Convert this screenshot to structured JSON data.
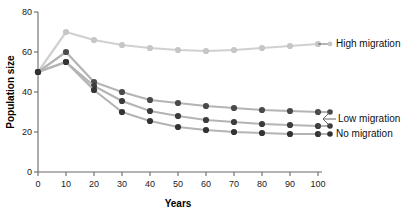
{
  "chart_data": {
    "type": "line",
    "title": "",
    "xlabel": "Years",
    "ylabel": "Population size",
    "x": [
      0,
      10,
      20,
      30,
      40,
      50,
      60,
      70,
      80,
      90,
      100
    ],
    "xlim": [
      0,
      100
    ],
    "ylim": [
      0,
      80
    ],
    "xticks": [
      "0",
      "10",
      "20",
      "30",
      "40",
      "50",
      "60",
      "70",
      "80",
      "90",
      "100"
    ],
    "yticks": [
      "0",
      "20",
      "40",
      "60",
      "80"
    ],
    "grid": false,
    "legend_position": "right-inline-labels",
    "series": [
      {
        "name": "High migration",
        "color": "#d0d0d0",
        "marker_color": "#c6c6c6",
        "values": [
          50,
          70,
          66,
          63.5,
          62,
          61,
          60.5,
          61,
          62,
          63,
          64
        ]
      },
      {
        "name": "Low migration",
        "color": "#b4b4b4",
        "marker_color": "#4a4a4a",
        "values": [
          50,
          60,
          45,
          40,
          36,
          34.5,
          33,
          32,
          31,
          30.5,
          30
        ]
      },
      {
        "name": "Low migration",
        "color": "#b4b4b4",
        "marker_color": "#3c3c3c",
        "values": [
          50,
          55,
          43,
          35.5,
          30.5,
          28,
          26,
          25,
          24,
          23.5,
          23
        ]
      },
      {
        "name": "No migration",
        "color": "#b4b4b4",
        "marker_color": "#333333",
        "values": [
          50,
          55,
          41,
          30,
          25.5,
          22.5,
          21,
          20,
          19.5,
          19,
          19
        ]
      }
    ],
    "annotations": [
      {
        "text": "High migration",
        "for_series": "High migration",
        "x": 100,
        "y": 64
      },
      {
        "text": "Low migration",
        "for_series": "Low migration",
        "x": 100,
        "y": 26.5
      },
      {
        "text": "No migration",
        "for_series": "No migration",
        "x": 100,
        "y": 19
      }
    ]
  },
  "labels": {
    "y_axis_title": "Population size",
    "x_axis_title": "Years",
    "high_migration": "High migration",
    "low_migration": "Low migration",
    "no_migration": "No migration"
  }
}
